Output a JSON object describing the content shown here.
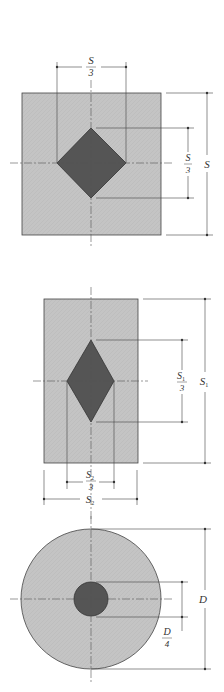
{
  "colors": {
    "outer_fill": "#c4c4c4",
    "inner_fill": "#555555",
    "stroke": "#333333",
    "dim_line": "#444444",
    "centerline": "#555555"
  },
  "figures": [
    {
      "name": "square-section-diamond",
      "labels": {
        "top_num": "S",
        "top_den": "3",
        "right_inner_num": "S",
        "right_inner_den": "3",
        "right_outer": "S"
      }
    },
    {
      "name": "rectangular-section-diamond",
      "labels": {
        "right_inner_num": "S",
        "right_inner_sub": "1",
        "right_inner_den": "3",
        "right_outer": "S",
        "right_outer_sub": "1",
        "bottom_inner_num": "S",
        "bottom_inner_sub": "2",
        "bottom_inner_den": "3",
        "bottom_outer": "S",
        "bottom_outer_sub": "2"
      }
    },
    {
      "name": "circular-section-circle",
      "labels": {
        "right_outer": "D",
        "right_inner_num": "D",
        "right_inner_den": "4"
      }
    }
  ]
}
